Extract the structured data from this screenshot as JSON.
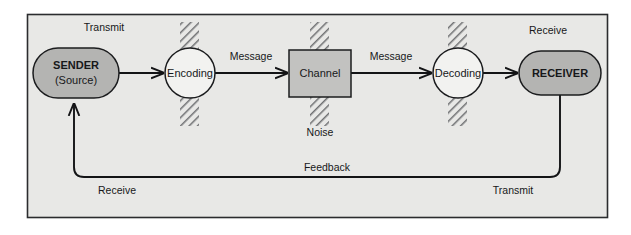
{
  "diagram": {
    "canvas": {
      "width": 631,
      "height": 235
    },
    "frame": {
      "x": 27,
      "y": 14,
      "width": 580,
      "height": 203,
      "fill": "#e8e8e6",
      "stroke": "#2b2c2e"
    },
    "colors": {
      "background": "#ffffff",
      "panel": "#e8e8e6",
      "node_fill_gray": "#b4b4b2",
      "node_fill_white": "#f2f2f0",
      "channel_fill": "#c2c2c0",
      "stroke": "#1b1c1e",
      "line": "#131416",
      "text": "#17181a",
      "hatch": "#6f7072"
    },
    "nodes": [
      {
        "id": "sender",
        "name": "sender-node",
        "shape": "stadium",
        "lines": [
          "SENDER",
          "(Source)"
        ],
        "fill": "#b4b4b2",
        "x": 33,
        "y": 48,
        "width": 86,
        "height": 50
      },
      {
        "id": "encoding",
        "name": "encoding-node",
        "shape": "circle",
        "lines": [
          "Encoding"
        ],
        "fill": "#f2f2f0",
        "cx": 190,
        "cy": 73,
        "r": 25
      },
      {
        "id": "channel",
        "name": "channel-node",
        "shape": "rect",
        "lines": [
          "Channel"
        ],
        "fill": "#c2c2c0",
        "x": 289,
        "y": 50,
        "width": 62,
        "height": 47
      },
      {
        "id": "decoding",
        "name": "decoding-node",
        "shape": "circle",
        "lines": [
          "Decoding"
        ],
        "fill": "#f2f2f0",
        "cx": 458,
        "cy": 73,
        "r": 25
      },
      {
        "id": "receiver",
        "name": "receiver-node",
        "shape": "stadium",
        "lines": [
          "RECEIVER"
        ],
        "fill": "#b4b4b2",
        "x": 519,
        "y": 51,
        "width": 82,
        "height": 44
      }
    ],
    "noise_bands": [
      {
        "name": "noise-band-encoding",
        "x": 180,
        "y": 22,
        "width": 19,
        "height": 104
      },
      {
        "name": "noise-band-channel",
        "x": 310,
        "y": 22,
        "width": 19,
        "height": 104
      },
      {
        "name": "noise-band-decoding",
        "x": 448,
        "y": 22,
        "width": 19,
        "height": 104
      }
    ],
    "flows": [
      {
        "name": "flow-sender-to-encoding",
        "from": "sender",
        "to": "encoding",
        "label": ""
      },
      {
        "name": "flow-encoding-to-channel",
        "from": "encoding",
        "to": "channel",
        "label": "Message"
      },
      {
        "name": "flow-channel-to-decoding",
        "from": "channel",
        "to": "decoding",
        "label": "Message"
      },
      {
        "name": "flow-decoding-to-receiver",
        "from": "decoding",
        "to": "receiver",
        "label": ""
      }
    ],
    "labels": {
      "transmit_top": "Transmit",
      "receive_top": "Receive",
      "message_left": "Message",
      "message_right": "Message",
      "noise": "Noise",
      "feedback": "Feedback",
      "receive_bottom": "Receive",
      "transmit_bottom": "Transmit"
    },
    "feedback_path": {
      "name": "feedback-path",
      "description": "Loop from RECEIVER bottom, left along bottom, up into SENDER bottom with arrowhead",
      "label": "Feedback"
    }
  }
}
